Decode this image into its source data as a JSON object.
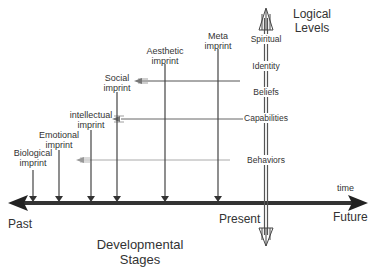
{
  "title": {
    "line1": "Logical",
    "line2": "Levels"
  },
  "axis": {
    "past": "Past",
    "present": "Present",
    "future": "Future",
    "time": "time"
  },
  "footer": {
    "line1": "Developmental",
    "line2": "Stages"
  },
  "imprints": [
    {
      "line1": "Biological",
      "line2": "imprint",
      "x": 33,
      "top": 170
    },
    {
      "line1": "Emotional",
      "line2": "imprint",
      "x": 59,
      "top": 150
    },
    {
      "line1": "intellectual",
      "line2": "imprint",
      "x": 91,
      "top": 130
    },
    {
      "line1": "Social",
      "line2": "imprint",
      "x": 117,
      "top": 92
    },
    {
      "line1": "Aesthetic",
      "line2": "imprint",
      "x": 165,
      "top": 64
    },
    {
      "line1": "Meta",
      "line2": "imprint",
      "x": 218,
      "top": 49
    }
  ],
  "levels": [
    {
      "label": "Spiritual",
      "y": 40
    },
    {
      "label": "Identity",
      "y": 66
    },
    {
      "label": "Beliefs",
      "y": 92
    },
    {
      "label": "Capabilities",
      "y": 118
    },
    {
      "label": "Behaviors",
      "y": 160
    }
  ],
  "colors": {
    "line": "#444444",
    "light": "#aaaaaa",
    "axis": "#333333"
  }
}
